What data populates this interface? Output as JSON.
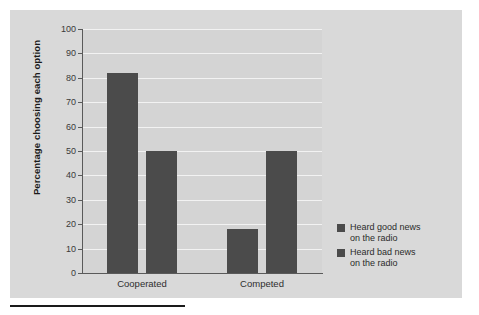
{
  "chart_data": {
    "type": "bar",
    "title": "",
    "xlabel": "",
    "ylabel": "Percentage choosing each option",
    "categories": [
      "Cooperated",
      "Competed"
    ],
    "series": [
      {
        "name": "Heard good news\non the radio",
        "values": [
          82,
          18
        ]
      },
      {
        "name": "Heard bad news\non the radio",
        "values": [
          50,
          50
        ]
      }
    ],
    "ylim": [
      0,
      100
    ],
    "y_ticks": [
      0,
      10,
      20,
      30,
      40,
      50,
      60,
      70,
      80,
      90,
      100
    ],
    "y_tick_labels": [
      "0",
      "10",
      "20",
      "30",
      "40",
      "50",
      "60",
      "70",
      "80",
      "90",
      "100"
    ],
    "grid": true,
    "legend_position": "right",
    "colors": {
      "bar": "#4b4b4b",
      "panel_background": "#d9d9d9",
      "plot_background": "#d4d4d4",
      "gridline": "#f2f2f2",
      "axis": "#5a5a5a",
      "text": "#2b2b2b",
      "rule": "#1a1a1a"
    }
  },
  "legend": {
    "entries": [
      {
        "label": "Heard good news\non the radio"
      },
      {
        "label": "Heard bad news\non the radio"
      }
    ]
  },
  "axes": {
    "y_title": "Percentage choosing each option",
    "category_labels": [
      "Cooperated",
      "Competed"
    ]
  }
}
